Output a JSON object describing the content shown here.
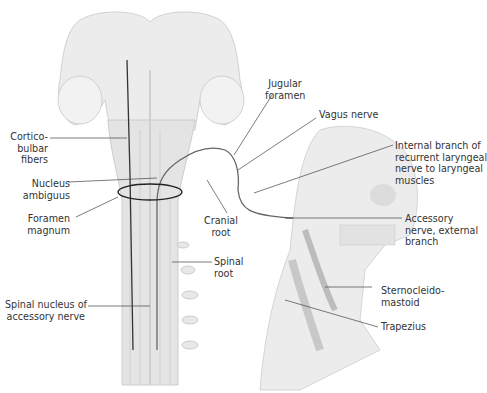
{
  "figure": {
    "colors": {
      "background": "#ffffff",
      "tissue_fill": "#e6e6e6",
      "tissue_shade": "#cfcfcf",
      "nerve": "#555555",
      "leader_line": "#444444",
      "label_text": "#333333"
    }
  },
  "labels": {
    "corticobulbar": {
      "line1": "Cortico-",
      "line2": "bulbar",
      "line3": "fibers"
    },
    "nucleus_ambiguus": {
      "line1": "Nucleus",
      "line2": "ambiguus"
    },
    "foramen_magnum": {
      "line1": "Foramen",
      "line2": "magnum"
    },
    "spinal_nucleus": {
      "line1": "Spinal nucleus of",
      "line2": "accessory nerve"
    },
    "jugular_foramen": {
      "line1": "Jugular",
      "line2": "foramen"
    },
    "vagus_nerve": {
      "line1": "Vagus nerve"
    },
    "internal_branch": {
      "line1": "Internal branch of",
      "line2": "recurrent laryngeal",
      "line3": "nerve to laryngeal",
      "line4": "muscles"
    },
    "cranial_root": {
      "line1": "Cranial",
      "line2": "root"
    },
    "accessory_external": {
      "line1": "Accessory",
      "line2": "nerve, external",
      "line3": "branch"
    },
    "spinal_root": {
      "line1": "Spinal",
      "line2": "root"
    },
    "sternocleidomastoid": {
      "line1": "Sternocleido-",
      "line2": "mastoid"
    },
    "trapezius": {
      "line1": "Trapezius"
    }
  }
}
